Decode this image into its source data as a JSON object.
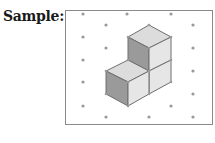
{
  "label": "Sample:",
  "diagram": {
    "type": "isometric-dot-grid-cubes",
    "frame": {
      "x": 65,
      "y": 10,
      "width": 147,
      "height": 114,
      "stroke": "#8a8a8a"
    },
    "dot_color": "#9a9a9a",
    "dots": [
      [
        83,
        14
      ],
      [
        127,
        14
      ],
      [
        171,
        14
      ],
      [
        106,
        25
      ],
      [
        193,
        25
      ],
      [
        83,
        37
      ],
      [
        106,
        48
      ],
      [
        193,
        48
      ],
      [
        83,
        60
      ],
      [
        193,
        71
      ],
      [
        83,
        82
      ],
      [
        193,
        94
      ],
      [
        83,
        106
      ],
      [
        171,
        106
      ],
      [
        106,
        117
      ],
      [
        149,
        117
      ],
      [
        193,
        117
      ]
    ],
    "cube_count": 3,
    "face_colors": {
      "top": "#dcdcdc",
      "left": "#9a9a9a",
      "right": "#e6e6e6",
      "edge": "#6e6e6e"
    },
    "faces": [
      {
        "name": "upper-cube-top",
        "shade": "top",
        "points": "128,37 149,25 171,37 149,48"
      },
      {
        "name": "upper-cube-left",
        "shade": "left",
        "points": "128,37 149,48 149,71 128,60"
      },
      {
        "name": "upper-cube-right",
        "shade": "right",
        "points": "149,48 171,37 171,60 149,71"
      },
      {
        "name": "lower-right-cube-right",
        "shade": "right",
        "points": "149,71 171,60 171,82 149,94"
      },
      {
        "name": "lower-left-cube-top",
        "shade": "top",
        "points": "106,71 128,60 149,71 128,82"
      },
      {
        "name": "lower-left-cube-left",
        "shade": "left",
        "points": "106,71 128,82 128,106 106,94"
      },
      {
        "name": "lower-left-cube-right",
        "shade": "right",
        "points": "128,82 149,71 149,94 128,106"
      }
    ],
    "vertices": [
      [
        149,
        25
      ],
      [
        128,
        37
      ],
      [
        171,
        37
      ],
      [
        149,
        48
      ],
      [
        128,
        60
      ],
      [
        171,
        60
      ],
      [
        149,
        71
      ],
      [
        106,
        71
      ],
      [
        171,
        82
      ],
      [
        128,
        82
      ],
      [
        106,
        94
      ],
      [
        149,
        94
      ],
      [
        128,
        106
      ]
    ]
  }
}
